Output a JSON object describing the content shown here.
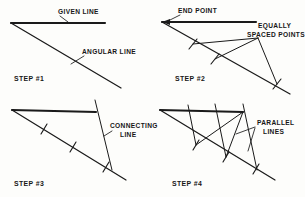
{
  "figure": {
    "background_color": "#fdfdfb",
    "ink_color": "#1a1a1a",
    "width": 305,
    "height": 197
  },
  "panels": [
    {
      "id": "step1",
      "step_label": "STEP #1",
      "step_label_pos": {
        "x": 14,
        "y": 81
      },
      "labels": [
        {
          "name": "given-line",
          "text": "GIVEN LINE",
          "x": 58,
          "y": 14
        },
        {
          "name": "angular-line",
          "text": "ANGULAR LINE",
          "x": 82,
          "y": 54
        }
      ],
      "apex": {
        "x": 11,
        "y": 23
      },
      "given_line": {
        "x1": 11,
        "y1": 23,
        "x2": 105,
        "y2": 23
      },
      "angular_line": {
        "x1": 11,
        "y1": 23,
        "x2": 121,
        "y2": 88
      },
      "leaders": [
        {
          "name": "given-line-leader",
          "x1": 60,
          "y1": 16,
          "x2": 68,
          "y2": 22
        },
        {
          "name": "angular-line-leader",
          "x1": 84,
          "y1": 56,
          "x2": 71,
          "y2": 64
        }
      ],
      "ticks": []
    },
    {
      "id": "step2",
      "step_label": "STEP #2",
      "step_label_pos": {
        "x": 175,
        "y": 81
      },
      "labels": [
        {
          "name": "end-point",
          "text": "END POINT",
          "x": 178,
          "y": 13
        },
        {
          "name": "equally-spaced-points-line1",
          "text": "EQUALLY",
          "x": 258,
          "y": 28
        },
        {
          "name": "equally-spaced-points-line2",
          "text": "SPACED POINTS",
          "x": 247,
          "y": 37
        }
      ],
      "apex": {
        "x": 162,
        "y": 22
      },
      "given_line": {
        "x1": 162,
        "y1": 22,
        "x2": 256,
        "y2": 22
      },
      "angular_line": {
        "x1": 162,
        "y1": 22,
        "x2": 290,
        "y2": 94
      },
      "end_point_marker": {
        "x": 164,
        "y": 22
      },
      "converge_point": {
        "x": 258,
        "y": 38
      },
      "rays": [
        {
          "name": "ray-to-point-1",
          "x1": 258,
          "y1": 38,
          "x2": 193,
          "y2": 44
        },
        {
          "name": "ray-to-point-2",
          "x1": 258,
          "y1": 38,
          "x2": 215,
          "y2": 59
        },
        {
          "name": "ray-to-point-3",
          "x1": 258,
          "y1": 38,
          "x2": 277,
          "y2": 84
        }
      ],
      "leaders": [
        {
          "name": "end-point-leader",
          "x1": 180,
          "y1": 15,
          "x2": 168,
          "y2": 21
        }
      ],
      "ticks": [
        {
          "name": "tick-1",
          "x": 193,
          "y": 44
        },
        {
          "name": "tick-2",
          "x": 215,
          "y": 59
        },
        {
          "name": "tick-3",
          "x": 277,
          "y": 84
        }
      ]
    },
    {
      "id": "step3",
      "step_label": "STEP #3",
      "step_label_pos": {
        "x": 14,
        "y": 186
      },
      "labels": [
        {
          "name": "connecting-line-line1",
          "text": "CONNECTING",
          "x": 110,
          "y": 128
        },
        {
          "name": "connecting-line-line2",
          "text": "LINE",
          "x": 120,
          "y": 137
        }
      ],
      "apex": {
        "x": 12,
        "y": 110
      },
      "given_line": {
        "x1": 12,
        "y1": 110,
        "x2": 96,
        "y2": 112
      },
      "angular_line": {
        "x1": 12,
        "y1": 110,
        "x2": 126,
        "y2": 180
      },
      "connecting_line": {
        "x1": 95,
        "y1": 100,
        "x2": 112,
        "y2": 170
      },
      "leaders": [
        {
          "name": "connecting-line-leader",
          "x1": 112,
          "y1": 131,
          "x2": 104,
          "y2": 136
        }
      ],
      "ticks": [
        {
          "name": "tick-1",
          "x": 44,
          "y": 129
        },
        {
          "name": "tick-2",
          "x": 73,
          "y": 147
        },
        {
          "name": "tick-3",
          "x": 106,
          "y": 167
        }
      ]
    },
    {
      "id": "step4",
      "step_label": "STEP #4",
      "step_label_pos": {
        "x": 172,
        "y": 186
      },
      "labels": [
        {
          "name": "parallel-lines-line1",
          "text": "PARALLEL",
          "x": 257,
          "y": 125
        },
        {
          "name": "parallel-lines-line2",
          "text": "LINES",
          "x": 263,
          "y": 134
        }
      ],
      "apex": {
        "x": 160,
        "y": 110
      },
      "given_line": {
        "x1": 160,
        "y1": 110,
        "x2": 243,
        "y2": 112
      },
      "angular_line": {
        "x1": 160,
        "y1": 110,
        "x2": 275,
        "y2": 180
      },
      "parallel_lines": [
        {
          "name": "parallel-line-1",
          "x1": 188,
          "y1": 105,
          "x2": 196,
          "y2": 145
        },
        {
          "name": "parallel-line-2",
          "x1": 215,
          "y1": 104,
          "x2": 226,
          "y2": 157
        },
        {
          "name": "parallel-line-3",
          "x1": 243,
          "y1": 104,
          "x2": 257,
          "y2": 170
        }
      ],
      "connector_rays": [
        {
          "name": "connector-ray-1",
          "x1": 243,
          "y1": 112,
          "x2": 196,
          "y2": 145
        },
        {
          "name": "connector-ray-2",
          "x1": 243,
          "y1": 112,
          "x2": 226,
          "y2": 157
        }
      ],
      "leaders": [
        {
          "name": "parallel-lines-leader-upper",
          "x1": 255,
          "y1": 127,
          "x2": 236,
          "y2": 134
        },
        {
          "name": "parallel-lines-leader-lower",
          "x1": 255,
          "y1": 128,
          "x2": 248,
          "y2": 151
        }
      ],
      "ticks": [
        {
          "name": "tick-1",
          "x": 196,
          "y": 145
        },
        {
          "name": "tick-2",
          "x": 226,
          "y": 157
        },
        {
          "name": "tick-3",
          "x": 256,
          "y": 169
        }
      ]
    }
  ]
}
